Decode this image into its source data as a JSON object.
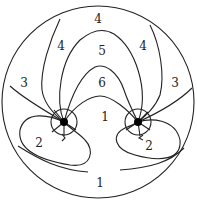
{
  "diagram": {
    "outer_circle": {
      "cx": 98,
      "cy": 102,
      "r": 96
    },
    "singular_points": [
      {
        "name": "left-point",
        "cx": 64,
        "cy": 122
      },
      {
        "name": "right-point",
        "cx": 138,
        "cy": 122
      }
    ],
    "region_labels": [
      {
        "text": "4",
        "x": 98,
        "y": 23
      },
      {
        "text": "4",
        "x": 61,
        "y": 50
      },
      {
        "text": "5",
        "x": 102,
        "y": 55
      },
      {
        "text": "4",
        "x": 143,
        "y": 50
      },
      {
        "text": "3",
        "x": 24,
        "y": 87
      },
      {
        "text": "6",
        "x": 102,
        "y": 87
      },
      {
        "text": "3",
        "x": 175,
        "y": 87
      },
      {
        "text": "1",
        "x": 105,
        "y": 121
      },
      {
        "text": "2",
        "x": 39,
        "y": 147
      },
      {
        "text": "2",
        "x": 149,
        "y": 150
      },
      {
        "text": "1",
        "x": 100,
        "y": 187
      }
    ]
  }
}
